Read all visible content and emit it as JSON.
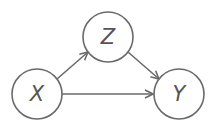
{
  "diagram": {
    "type": "causal-dag",
    "colors": {
      "stroke": "#6a6a6a",
      "label": "#555555",
      "background": "#ffffff"
    },
    "nodes": [
      {
        "id": "X",
        "label": "X",
        "cx": 37,
        "cy": 94,
        "r": 25
      },
      {
        "id": "Z",
        "label": "Z",
        "cx": 108,
        "cy": 37,
        "r": 25
      },
      {
        "id": "Y",
        "label": "Y",
        "cx": 179,
        "cy": 94,
        "r": 25
      }
    ],
    "edges": [
      {
        "from": "X",
        "to": "Z"
      },
      {
        "from": "Z",
        "to": "Y"
      },
      {
        "from": "X",
        "to": "Y"
      }
    ]
  }
}
